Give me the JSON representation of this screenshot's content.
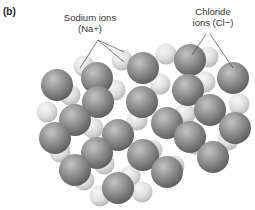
{
  "panel_label": "(b)",
  "labels": {
    "sodium_line1": "Sodium ions",
    "sodium_line2": "(Na+)",
    "chloride_line1": "Chloride",
    "chloride_line2": "ions (Cl−)"
  },
  "colors": {
    "chloride": "#8a8a8a",
    "sodium": "#dcdcdc",
    "leader_line": "#444444"
  },
  "diagram": {
    "type": "NaCl crystal lattice",
    "sodium": [
      [
        84,
        66
      ],
      [
        122,
        60
      ],
      [
        166,
        54
      ],
      [
        208,
        57
      ],
      [
        70,
        95
      ],
      [
        115,
        90
      ],
      [
        160,
        84
      ],
      [
        205,
        82
      ],
      [
        239,
        104
      ],
      [
        47,
        112
      ],
      [
        93,
        128
      ],
      [
        137,
        120
      ],
      [
        185,
        114
      ],
      [
        228,
        140
      ],
      [
        60,
        152
      ],
      [
        104,
        164
      ],
      [
        152,
        150
      ],
      [
        195,
        144
      ],
      [
        84,
        180
      ],
      [
        130,
        176
      ],
      [
        174,
        166
      ],
      [
        142,
        192
      ],
      [
        100,
        196
      ]
    ],
    "chloride": [
      [
        57,
        85
      ],
      [
        97,
        78
      ],
      [
        143,
        68
      ],
      [
        190,
        60
      ],
      [
        233,
        78
      ],
      [
        98,
        102
      ],
      [
        142,
        102
      ],
      [
        188,
        90
      ],
      [
        75,
        120
      ],
      [
        118,
        135
      ],
      [
        167,
        123
      ],
      [
        210,
        110
      ],
      [
        235,
        128
      ],
      [
        55,
        138
      ],
      [
        97,
        153
      ],
      [
        143,
        155
      ],
      [
        190,
        137
      ],
      [
        213,
        157
      ],
      [
        75,
        170
      ],
      [
        167,
        172
      ],
      [
        118,
        188
      ]
    ]
  }
}
